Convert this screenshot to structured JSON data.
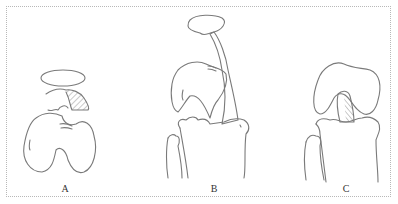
{
  "figure": {
    "panels": [
      {
        "label": "A",
        "description": "separated patella, hatched ligament fragment, femoral condyles"
      },
      {
        "label": "B",
        "description": "lateral view with patella elevated, long hatched ligament to tibia"
      },
      {
        "label": "C",
        "description": "anterior view of knee with hatched cruciate ligament between femur and tibia"
      }
    ]
  },
  "colors": {
    "line": "#7a7a7a",
    "border": "#b8b8b8",
    "background": "#ffffff"
  }
}
